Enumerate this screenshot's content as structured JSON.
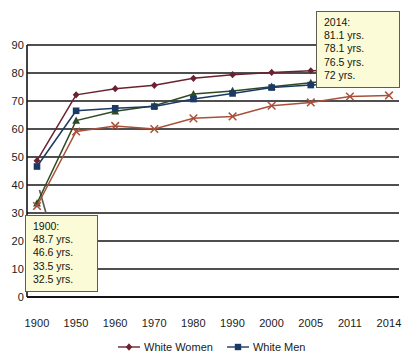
{
  "chart_data": {
    "type": "line",
    "title": "",
    "xlabel": "",
    "ylabel": "",
    "categories": [
      "1900",
      "1950",
      "1960",
      "1970",
      "1980",
      "1990",
      "2000",
      "2005",
      "2011",
      "2014"
    ],
    "ylim": [
      0,
      90
    ],
    "ytick_step": 10,
    "yticks": [
      "0",
      "10",
      "20",
      "30",
      "40",
      "50",
      "60",
      "70",
      "80",
      "90"
    ],
    "grid": "horizontal",
    "legend_position": "bottom",
    "series": [
      {
        "name": "White Women",
        "marker": "diamond",
        "color": "#6b2230",
        "values": [
          48.7,
          72.2,
          74.4,
          75.6,
          78.1,
          79.4,
          80.2,
          80.8,
          81.1,
          81.1
        ]
      },
      {
        "name": "Black Women",
        "marker": "triangle",
        "color": "#2f4a22",
        "values": [
          33.5,
          63.0,
          66.3,
          68.3,
          72.5,
          73.6,
          75.1,
          76.5,
          78.0,
          78.1
        ]
      },
      {
        "name": "White Men",
        "marker": "square",
        "color": "#1b3a63",
        "values": [
          46.6,
          66.5,
          67.4,
          68.0,
          70.7,
          72.7,
          74.8,
          75.7,
          76.3,
          76.5
        ]
      },
      {
        "name": "Black Men",
        "marker": "x",
        "color": "#a8503a",
        "values": [
          32.5,
          59.1,
          61.1,
          60.0,
          63.8,
          64.5,
          68.3,
          69.5,
          71.6,
          72.0
        ]
      }
    ],
    "annotations": [
      {
        "id": "callout-2014",
        "lines": [
          "2014:",
          "81.1 yrs.",
          "78.1 yrs.",
          "76.5 yrs.",
          "72 yrs."
        ]
      },
      {
        "id": "callout-1900",
        "lines": [
          "1900:",
          "48.7 yrs.",
          "46.6 yrs.",
          "33.5 yrs.",
          "32.5 yrs."
        ]
      }
    ],
    "legend_entries": [
      {
        "label": "White Women",
        "marker": "diamond",
        "color": "#6b2230"
      },
      {
        "label": "White Men",
        "marker": "square",
        "color": "#1b3a63"
      }
    ]
  },
  "colors": {
    "axis": "#141414",
    "grid": "#141414",
    "callout_fill": "#fbfbd8",
    "callout_border": "#5d5d52",
    "text": "#1a1a1a"
  }
}
